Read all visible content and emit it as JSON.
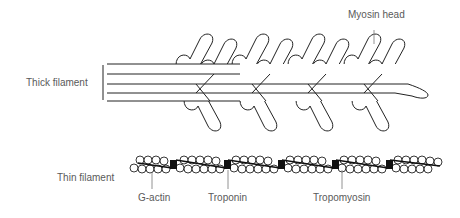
{
  "labels": {
    "thick_filament": "Thick filament",
    "thin_filament": "Thin filament",
    "myosin_head": "Myosin head",
    "g_actin": "G-actin",
    "troponin": "Troponin",
    "tropomyosin": "Tropomyosin"
  },
  "colors": {
    "stroke": "#222222",
    "label_text": "#5a5a5a",
    "leader_line": "#777777",
    "troponin_fill": "#111111",
    "background": "#ffffff"
  }
}
